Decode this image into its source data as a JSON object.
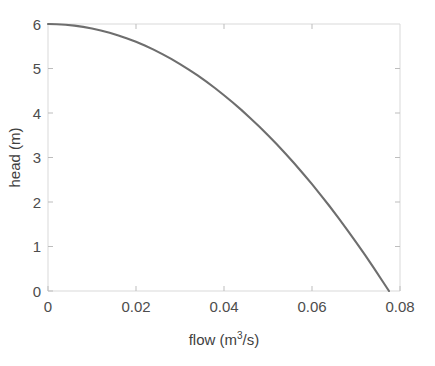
{
  "chart_data": {
    "type": "line",
    "title": "",
    "subtitle": "",
    "xlabel": "flow (m^3/s)",
    "xlabel_base": "flow (m",
    "xlabel_sup": "3",
    "xlabel_tail": "/s)",
    "ylabel": "head (m)",
    "xlim": [
      0,
      0.08
    ],
    "ylim": [
      0,
      6
    ],
    "xticks": [
      0,
      0.02,
      0.04,
      0.06,
      0.08
    ],
    "xtick_labels": [
      "0",
      "0.02",
      "0.04",
      "0.06",
      "0.08"
    ],
    "yticks": [
      0,
      1,
      2,
      3,
      4,
      5,
      6
    ],
    "ytick_labels": [
      "0",
      "1",
      "2",
      "3",
      "4",
      "5",
      "6"
    ],
    "grid": false,
    "legend": null,
    "legend_position": "none",
    "series": [
      {
        "name": "pump head curve",
        "color": "#6e6e6e",
        "x": [
          0,
          0.002,
          0.004,
          0.006,
          0.008,
          0.01,
          0.012,
          0.014,
          0.016,
          0.018,
          0.02,
          0.022,
          0.024,
          0.026,
          0.028,
          0.03,
          0.032,
          0.034,
          0.036,
          0.038,
          0.04,
          0.042,
          0.044,
          0.046,
          0.048,
          0.05,
          0.052,
          0.054,
          0.056,
          0.058,
          0.06,
          0.062,
          0.064,
          0.066,
          0.068,
          0.07,
          0.072,
          0.074,
          0.076,
          0.0775
        ],
        "y": [
          6.0,
          5.996,
          5.984,
          5.964,
          5.936,
          5.9,
          5.856,
          5.804,
          5.744,
          5.676,
          5.6,
          5.516,
          5.424,
          5.324,
          5.216,
          5.1,
          4.976,
          4.844,
          4.704,
          4.556,
          4.4,
          4.236,
          4.064,
          3.884,
          3.696,
          3.5,
          3.296,
          3.084,
          2.864,
          2.636,
          2.4,
          2.156,
          1.904,
          1.644,
          1.376,
          1.1,
          0.816,
          0.524,
          0.224,
          0.0
        ]
      }
    ],
    "annotations": []
  },
  "colors": {
    "curve": "#6e6e6e",
    "frame": "#d9d9d9",
    "tick_mark": "#bdbdbd",
    "tick_text": "#4d4d4d",
    "axis_title": "#3f3f3f",
    "background": "#ffffff"
  }
}
